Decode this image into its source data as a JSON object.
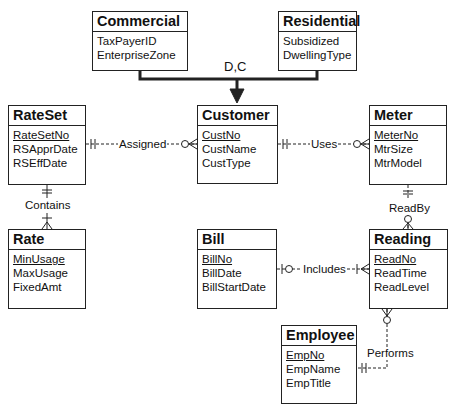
{
  "diagram": {
    "type": "ERD (crow's foot)",
    "entities": {
      "commercial": {
        "name": "Commercial",
        "weak": false,
        "attributes": [
          {
            "name": "TaxPayerID",
            "pk": false
          },
          {
            "name": "EnterpriseZone",
            "pk": false
          }
        ]
      },
      "residential": {
        "name": "Residential",
        "weak": false,
        "attributes": [
          {
            "name": "Subsidized",
            "pk": false
          },
          {
            "name": "DwellingType",
            "pk": false
          }
        ]
      },
      "rateset": {
        "name": "RateSet",
        "weak": false,
        "attributes": [
          {
            "name": "RateSetNo",
            "pk": true
          },
          {
            "name": "RSApprDate",
            "pk": false
          },
          {
            "name": "RSEffDate",
            "pk": false
          }
        ]
      },
      "customer": {
        "name": "Customer",
        "weak": false,
        "attributes": [
          {
            "name": "CustNo",
            "pk": true
          },
          {
            "name": "CustName",
            "pk": false
          },
          {
            "name": "CustType",
            "pk": false
          }
        ]
      },
      "meter": {
        "name": "Meter",
        "weak": false,
        "attributes": [
          {
            "name": "MeterNo",
            "pk": true
          },
          {
            "name": "MtrSize",
            "pk": false
          },
          {
            "name": "MtrModel",
            "pk": false
          }
        ]
      },
      "rate": {
        "name": "Rate",
        "weak": true,
        "attributes": [
          {
            "name": "MinUsage",
            "pk": true
          },
          {
            "name": "MaxUsage",
            "pk": false
          },
          {
            "name": "FixedAmt",
            "pk": false
          }
        ]
      },
      "bill": {
        "name": "Bill",
        "weak": false,
        "attributes": [
          {
            "name": "BillNo",
            "pk": true
          },
          {
            "name": "BillDate",
            "pk": false
          },
          {
            "name": "BillStartDate",
            "pk": false
          }
        ]
      },
      "reading": {
        "name": "Reading",
        "weak": false,
        "attributes": [
          {
            "name": "ReadNo",
            "pk": true
          },
          {
            "name": "ReadTime",
            "pk": false
          },
          {
            "name": "ReadLevel",
            "pk": false
          }
        ]
      },
      "employee": {
        "name": "Employee",
        "weak": false,
        "attributes": [
          {
            "name": "EmpNo",
            "pk": true
          },
          {
            "name": "EmpName",
            "pk": false
          },
          {
            "name": "EmpTitle",
            "pk": false
          }
        ]
      }
    },
    "generalization": {
      "label": "D,C",
      "supertype": "Customer",
      "subtypes": [
        "Commercial",
        "Residential"
      ]
    },
    "relationships": {
      "assigned": {
        "label": "Assigned",
        "from": "RateSet",
        "from_card": "exactly-one",
        "to": "Customer",
        "to_card": "zero-or-many",
        "identifying": false
      },
      "uses": {
        "label": "Uses",
        "from": "Customer",
        "from_card": "exactly-one",
        "to": "Meter",
        "to_card": "zero-or-many",
        "identifying": false
      },
      "contains": {
        "label": "Contains",
        "from": "RateSet",
        "from_card": "exactly-one",
        "to": "Rate",
        "to_card": "one-or-many",
        "identifying": true
      },
      "readby": {
        "label": "ReadBy",
        "from": "Meter",
        "from_card": "exactly-one",
        "to": "Reading",
        "to_card": "zero-or-many",
        "identifying": false
      },
      "includes": {
        "label": "Includes",
        "from": "Bill",
        "from_card": "zero-or-one",
        "to": "Reading",
        "to_card": "one-or-many",
        "identifying": false
      },
      "performs": {
        "label": "Performs",
        "from": "Employee",
        "from_card": "exactly-one",
        "to": "Reading",
        "to_card": "zero-or-many",
        "identifying": false
      }
    }
  }
}
